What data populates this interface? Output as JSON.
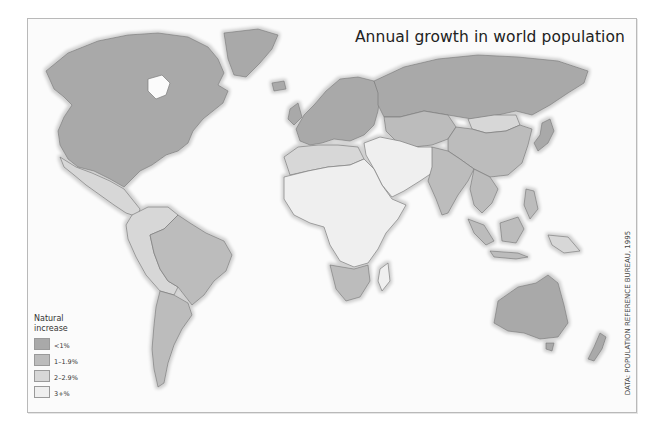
{
  "title": "Annual growth in world population",
  "credit": "DATA: POPULATION REFERENCE BUREAU, 1995",
  "legend": {
    "title_line1": "Natural",
    "title_line2": "increase",
    "items": [
      {
        "label": "<1%",
        "color": "#a9a9a9"
      },
      {
        "label": "1–1.9%",
        "color": "#bcbcbc"
      },
      {
        "label": "2–2.9%",
        "color": "#d7d7d7"
      },
      {
        "label": "3+%",
        "color": "#efefef"
      }
    ]
  },
  "colors": {
    "lt1": "#a9a9a9",
    "r1": "#bcbcbc",
    "r2": "#d7d7d7",
    "r3": "#efefef",
    "border": "#7c7c7c",
    "halo": "#dcdcdc"
  },
  "regions": [
    {
      "name": "north-america",
      "class": "lt1"
    },
    {
      "name": "greenland",
      "class": "lt1"
    },
    {
      "name": "mexico-central-america",
      "class": "r2"
    },
    {
      "name": "south-america-north",
      "class": "r2"
    },
    {
      "name": "brazil",
      "class": "r1"
    },
    {
      "name": "southern-cone",
      "class": "r1"
    },
    {
      "name": "europe",
      "class": "lt1"
    },
    {
      "name": "russia",
      "class": "lt1"
    },
    {
      "name": "central-asia",
      "class": "r1"
    },
    {
      "name": "mongolia",
      "class": "r2"
    },
    {
      "name": "china",
      "class": "r1"
    },
    {
      "name": "middle-east",
      "class": "r3"
    },
    {
      "name": "north-africa",
      "class": "r2"
    },
    {
      "name": "sub-saharan-africa",
      "class": "r3"
    },
    {
      "name": "southern-africa",
      "class": "r1"
    },
    {
      "name": "madagascar",
      "class": "r3"
    },
    {
      "name": "india",
      "class": "r1"
    },
    {
      "name": "southeast-asia",
      "class": "r1"
    },
    {
      "name": "japan",
      "class": "lt1"
    },
    {
      "name": "australia",
      "class": "lt1"
    },
    {
      "name": "new-zealand",
      "class": "lt1"
    },
    {
      "name": "papua-new-guinea",
      "class": "r2"
    }
  ]
}
